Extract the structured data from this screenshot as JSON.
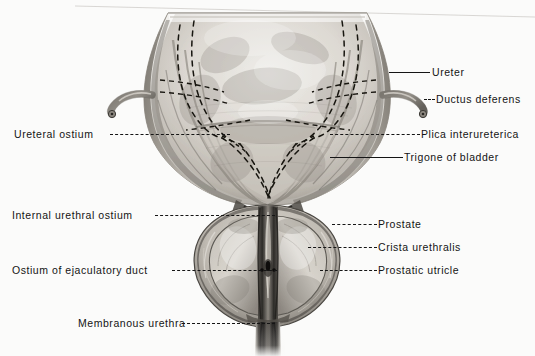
{
  "figure": {
    "style": "grayscale halftone anatomical illustration",
    "background_color": "#fbfbfa",
    "ink_color": "#151515"
  },
  "labels": [
    {
      "id": "ureter",
      "text": "Ureter",
      "side": "right",
      "text_x": 432,
      "text_y": 66,
      "leader": {
        "x": 389,
        "y": 72,
        "width": 41,
        "style": "solid"
      },
      "icon": "leader-line-solid"
    },
    {
      "id": "ductus-deferens",
      "text": "Ductus deferens",
      "side": "right",
      "text_x": 436,
      "text_y": 93,
      "leader": {
        "x": 424,
        "y": 99,
        "width": 11,
        "style": "dashed"
      },
      "icon": "leader-line-dashed"
    },
    {
      "id": "ureteral-ostium",
      "text": "Ureteral  ostium",
      "side": "left",
      "text_x": 14,
      "text_y": 128,
      "leader": {
        "x": 110,
        "y": 134,
        "width": 120,
        "style": "dashed"
      },
      "icon": "leader-line-dashed"
    },
    {
      "id": "plica-interureterica",
      "text": "Plica interureterica",
      "side": "right",
      "text_x": 421,
      "text_y": 128,
      "leader": {
        "x": 330,
        "y": 134,
        "width": 90,
        "style": "dashed"
      },
      "icon": "leader-line-dashed"
    },
    {
      "id": "trigone-of-bladder",
      "text": "Trigone of bladder",
      "side": "right",
      "text_x": 404,
      "text_y": 151,
      "leader": {
        "x": 330,
        "y": 157,
        "width": 73,
        "style": "solid"
      },
      "icon": "leader-line-solid"
    },
    {
      "id": "internal-urethral-ostium",
      "text": "Internal urethral ostium",
      "side": "left",
      "text_x": 12,
      "text_y": 209,
      "leader": {
        "x": 155,
        "y": 215,
        "width": 120,
        "style": "dashed"
      },
      "icon": "leader-line-dashed"
    },
    {
      "id": "prostate",
      "text": "Prostate",
      "side": "right",
      "text_x": 378,
      "text_y": 218,
      "leader": {
        "x": 332,
        "y": 224,
        "width": 45,
        "style": "dashed"
      },
      "icon": "leader-line-dashed"
    },
    {
      "id": "crista-urethralis",
      "text": "Crista  urethralis",
      "side": "right",
      "text_x": 378,
      "text_y": 241,
      "leader": {
        "x": 308,
        "y": 247,
        "width": 69,
        "style": "dashed"
      },
      "icon": "leader-line-dashed"
    },
    {
      "id": "ostium-of-ejaculatory-duct",
      "text": "Ostium of ejaculatory duct",
      "side": "left",
      "text_x": 12,
      "text_y": 264,
      "leader": {
        "x": 172,
        "y": 270,
        "width": 105,
        "style": "dashed"
      },
      "icon": "leader-line-dashed"
    },
    {
      "id": "prostatic-utricle",
      "text": "Prostatic utricle",
      "side": "right",
      "text_x": 378,
      "text_y": 264,
      "leader": {
        "x": 320,
        "y": 270,
        "width": 57,
        "style": "dashed"
      },
      "icon": "leader-line-dashed"
    },
    {
      "id": "membranous-urethra",
      "text": "Membranous urethra",
      "side": "left",
      "text_x": 78,
      "text_y": 317,
      "leader": {
        "x": 182,
        "y": 323,
        "width": 93,
        "style": "dashed"
      },
      "icon": "leader-line-dashed"
    }
  ],
  "structures": {
    "bladder_dome": "urinary bladder opened coronally, mucosal interior",
    "ureters": "dashed course of both ureters through bladder wall",
    "ductus_deferens_left_stub": "cut ductus deferens, left side",
    "ductus_deferens_right_stub": "cut ductus deferens, right side",
    "trigone": "smooth triangular trigone of bladder",
    "prostate": "prostate gland, coronal section",
    "urethra": "prostatic and membranous urethra"
  }
}
